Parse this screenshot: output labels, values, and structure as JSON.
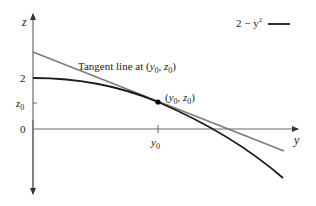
{
  "figure": {
    "axes": {
      "vertical_label": "z",
      "horizontal_label": "y",
      "ticks_vertical": [
        {
          "label": "2",
          "value": 2
        },
        {
          "label": "z",
          "sub": "0",
          "value": "z0"
        },
        {
          "label": "0",
          "value": 0
        }
      ],
      "ticks_horizontal": [
        {
          "label": "y",
          "sub": "0",
          "value": "y0"
        }
      ]
    },
    "legend": {
      "label_base": "2 − y",
      "label_sup": "2",
      "line_color": "#1a1a1a"
    },
    "curve": {
      "name": "2 - y^2",
      "color": "#1a1a1a"
    },
    "tangent": {
      "label_text": "Tangent line at (",
      "label_y": "y",
      "label_y_sub": "0",
      "label_sep": ", ",
      "label_z": "z",
      "label_z_sub": "0",
      "label_close": ")",
      "color": "#7a7a7a"
    },
    "point": {
      "label_open": "(",
      "label_y": "y",
      "label_y_sub": "0",
      "label_sep": ", ",
      "label_z": "z",
      "label_z_sub": "0",
      "label_close": ")"
    },
    "colors": {
      "axis": "#6a6a6a",
      "curve": "#1a1a1a",
      "tangent": "#7a7a7a",
      "text": "#222222"
    }
  }
}
